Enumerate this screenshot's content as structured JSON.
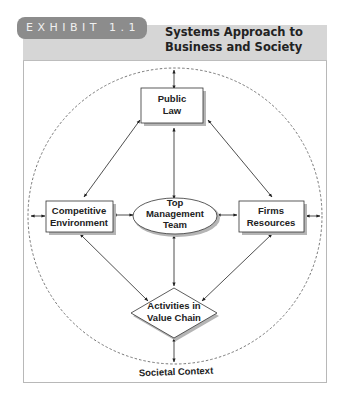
{
  "exhibit": {
    "label": "EXHIBIT 1.1",
    "title_line1": "Systems Approach to",
    "title_line2": "Business and Society"
  },
  "diagram": {
    "nodes": {
      "public_law": {
        "line1": "Public",
        "line2": "Law",
        "shape": "rectangle"
      },
      "competitive_environment": {
        "line1": "Competitive",
        "line2": "Environment",
        "shape": "rectangle"
      },
      "top_management_team": {
        "line1": "Top",
        "line2": "Management",
        "line3": "Team",
        "shape": "ellipse"
      },
      "firms_resources": {
        "line1": "Firms",
        "line2": "Resources",
        "shape": "rectangle"
      },
      "activities_value_chain": {
        "line1": "Activities in",
        "line2": "Value Chain",
        "shape": "diamond"
      }
    },
    "boundary": {
      "label": "Societal Context",
      "style": "dashed-circle"
    },
    "edges": [
      {
        "from": "public_law",
        "to": "societal_context",
        "type": "bidirectional"
      },
      {
        "from": "public_law",
        "to": "top_management_team",
        "type": "bidirectional"
      },
      {
        "from": "public_law",
        "to": "competitive_environment",
        "type": "bidirectional"
      },
      {
        "from": "public_law",
        "to": "firms_resources",
        "type": "bidirectional"
      },
      {
        "from": "competitive_environment",
        "to": "top_management_team",
        "type": "bidirectional"
      },
      {
        "from": "top_management_team",
        "to": "firms_resources",
        "type": "bidirectional"
      },
      {
        "from": "competitive_environment",
        "to": "societal_context",
        "type": "bidirectional"
      },
      {
        "from": "firms_resources",
        "to": "societal_context",
        "type": "bidirectional"
      },
      {
        "from": "competitive_environment",
        "to": "activities_value_chain",
        "type": "bidirectional"
      },
      {
        "from": "firms_resources",
        "to": "activities_value_chain",
        "type": "bidirectional"
      },
      {
        "from": "top_management_team",
        "to": "activities_value_chain",
        "type": "bidirectional"
      },
      {
        "from": "activities_value_chain",
        "to": "societal_context",
        "type": "bidirectional"
      }
    ]
  },
  "colors": {
    "header_band": "#d6d6d6",
    "exhibit_pill": "#8c8c8c",
    "stroke": "#333333",
    "shadow": "#b0b0b0"
  }
}
